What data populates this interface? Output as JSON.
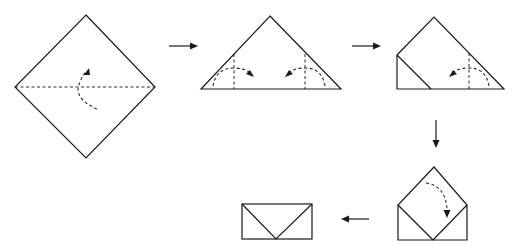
{
  "diagram": {
    "colors": {
      "line": "#1a1a1a",
      "background": "#ffffff"
    },
    "steps": [
      {
        "id": 1,
        "shape": "square-diamond",
        "instruction_icon": "fold-diagonal-up",
        "fold_lines": [
          "horizontal-diagonal"
        ]
      },
      {
        "id": 2,
        "shape": "triangle",
        "instruction_icon": "fold-corners-in",
        "fold_lines": [
          "left-vertical",
          "right-vertical"
        ]
      },
      {
        "id": 3,
        "shape": "triangle-left-folded",
        "instruction_icon": "fold-right-corner-in",
        "fold_lines": [
          "right-vertical"
        ]
      },
      {
        "id": 4,
        "shape": "pentagon-envelope-open",
        "instruction_icon": "fold-flap-down",
        "fold_lines": []
      },
      {
        "id": 5,
        "shape": "envelope-closed",
        "instruction_icon": null,
        "fold_lines": []
      }
    ],
    "transitions": [
      {
        "from": 1,
        "to": 2,
        "direction": "right"
      },
      {
        "from": 2,
        "to": 3,
        "direction": "right"
      },
      {
        "from": 3,
        "to": 4,
        "direction": "down"
      },
      {
        "from": 4,
        "to": 5,
        "direction": "left"
      }
    ]
  }
}
